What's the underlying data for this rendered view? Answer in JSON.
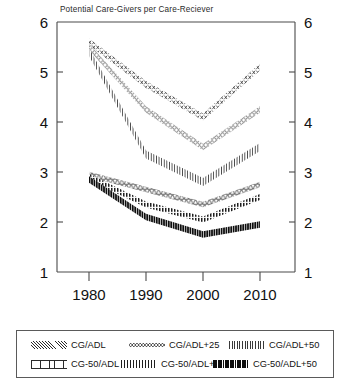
{
  "chart_data": {
    "type": "line",
    "title": "Potential Care-Givers per Care-Reciever",
    "xlabel": "",
    "ylabel": "",
    "x": [
      1980,
      1990,
      2000,
      2010
    ],
    "xticks": [
      "1980",
      "1990",
      "2000",
      "2010"
    ],
    "xlim": [
      1976,
      2014
    ],
    "ylim": [
      1,
      6
    ],
    "yticks": [
      "1",
      "2",
      "3",
      "4",
      "5",
      "6"
    ],
    "grid": false,
    "legend_position": "below-axes",
    "dual_y_axis": true,
    "series": [
      {
        "name": "CG/ADL",
        "values": [
          5.6,
          4.75,
          4.1,
          5.1
        ],
        "pattern": "bowtie-dots"
      },
      {
        "name": "CG/ADL+25",
        "values": [
          5.5,
          4.25,
          3.5,
          4.25
        ],
        "pattern": "open-circles"
      },
      {
        "name": "CG/ADL+50",
        "values": [
          5.4,
          3.35,
          2.8,
          3.5
        ],
        "pattern": "vertical-hatch"
      },
      {
        "name": "CG-50/ADL",
        "values": [
          2.95,
          2.65,
          2.35,
          2.75
        ],
        "pattern": "trapezoid-outline"
      },
      {
        "name": "CG-50/ADL+25",
        "values": [
          2.9,
          2.35,
          2.05,
          2.5
        ],
        "pattern": "cross-hatch"
      },
      {
        "name": "CG-50/ADL+50",
        "values": [
          2.85,
          2.1,
          1.75,
          1.95
        ],
        "pattern": "solid-bars"
      }
    ]
  },
  "legend": {
    "items": [
      {
        "label": "CG/ADL"
      },
      {
        "label": "CG/ADL+25"
      },
      {
        "label": "CG/ADL+50"
      },
      {
        "label": "CG-50/ADL"
      },
      {
        "label": "CG-50/ADL+25"
      },
      {
        "label": "CG-50/ADL+50"
      }
    ]
  },
  "axes": {
    "left_ticks": [
      "6",
      "5",
      "4",
      "3",
      "2",
      "1"
    ],
    "right_ticks": [
      "6",
      "5",
      "4",
      "3",
      "2",
      "1"
    ],
    "x_ticks": [
      "1980",
      "1990",
      "2000",
      "2010"
    ]
  },
  "colors": {
    "ink": "#111111",
    "axis": "#4a4a4a",
    "frame": "#5a5a5a",
    "background": "#ffffff"
  }
}
